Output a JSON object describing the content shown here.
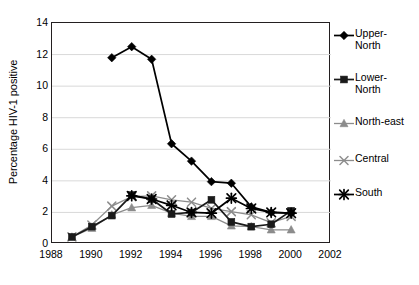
{
  "chart_data": {
    "type": "line",
    "title": "",
    "subtitle": "",
    "xlabel": "",
    "ylabel": "Percentage HIV-1 positive",
    "xlim": [
      1988,
      2002
    ],
    "ylim": [
      0,
      14
    ],
    "xticks": [
      1988,
      1990,
      1992,
      1994,
      1996,
      1998,
      2000,
      2002
    ],
    "yticks": [
      0,
      2,
      4,
      6,
      8,
      10,
      12,
      14
    ],
    "grid": "horizontal",
    "legend_position": "right",
    "series": [
      {
        "name": "Upper-North",
        "label": "Upper-\nNorth",
        "marker": "diamond",
        "color": "#000000",
        "x": [
          1991,
          1992,
          1993,
          1994,
          1995,
          1996,
          1997,
          1998,
          1999,
          2000
        ],
        "values": [
          11.8,
          12.5,
          11.7,
          6.35,
          5.25,
          3.95,
          3.85,
          2.35,
          2.0,
          1.95
        ]
      },
      {
        "name": "Lower-North",
        "label": "Lower-\nNorth",
        "marker": "square",
        "color": "#1a1a1a",
        "x": [
          1989,
          1990,
          1991,
          1992,
          1993,
          1994,
          1995,
          1996,
          1997,
          1998,
          1999,
          2000
        ],
        "values": [
          0.45,
          1.1,
          1.8,
          3.1,
          2.85,
          1.9,
          2.0,
          2.8,
          1.4,
          1.1,
          1.25,
          2.1
        ]
      },
      {
        "name": "North-east",
        "label": "North-east",
        "marker": "triangle",
        "color": "#8c8c8c",
        "x": [
          1989,
          1990,
          1991,
          1992,
          1993,
          1994,
          1995,
          1996,
          1997,
          1998,
          1999,
          2000
        ],
        "values": [
          0.45,
          1.0,
          1.85,
          2.3,
          2.45,
          1.95,
          1.75,
          1.75,
          1.15,
          1.1,
          0.9,
          0.9
        ]
      },
      {
        "name": "Central",
        "label": "Central",
        "marker": "x",
        "color": "#8c8c8c",
        "x": [
          1989,
          1990,
          1991,
          1992,
          1993,
          1994,
          1995,
          1996,
          1997,
          1998,
          1999,
          2000
        ],
        "values": [
          0.45,
          1.2,
          2.4,
          3.0,
          3.05,
          2.8,
          2.65,
          2.25,
          2.05,
          1.85,
          1.35,
          1.75
        ]
      },
      {
        "name": "South",
        "label": "South",
        "marker": "asterisk",
        "color": "#000000",
        "x": [
          1992,
          1993,
          1994,
          1995,
          1996,
          1997,
          1998,
          1999,
          2000
        ],
        "values": [
          3.05,
          2.85,
          2.45,
          2.0,
          1.95,
          2.9,
          2.25,
          2.0,
          1.95
        ]
      }
    ]
  },
  "legend": {
    "items": [
      {
        "label": "Upper-\nNorth",
        "marker": "diamond",
        "color": "#000000"
      },
      {
        "label": "Lower-\nNorth",
        "marker": "square",
        "color": "#1a1a1a"
      },
      {
        "label": "North-east",
        "marker": "triangle",
        "color": "#8c8c8c"
      },
      {
        "label": "Central",
        "marker": "x",
        "color": "#8c8c8c"
      },
      {
        "label": "South",
        "marker": "asterisk",
        "color": "#000000"
      }
    ]
  },
  "colors": {
    "axis": "#231f20",
    "grid": "#d9d9d9",
    "dark": "#000000",
    "gray": "#8c8c8c",
    "background": "#ffffff"
  }
}
